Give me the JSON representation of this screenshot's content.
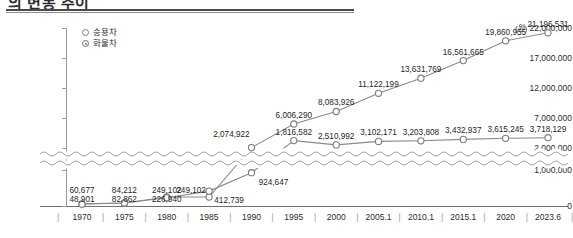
{
  "title": "의 변동 추이",
  "axis": {
    "unit_label": "(원)",
    "y_ticks": [
      "22,000,000",
      "17,000,000",
      "12,000,000",
      "7,000,000",
      "2,000,000",
      "1,000,000",
      "0"
    ],
    "x_ticks": [
      "1970",
      "1975",
      "1980",
      "1985",
      "1990",
      "1995",
      "2000",
      "2005.1",
      "2010.1",
      "2015.1",
      "2020",
      "2023.6"
    ]
  },
  "legend": [
    {
      "label": "승용차",
      "marker": "hollow-circle"
    },
    {
      "label": "화물차",
      "marker": "dot-circle"
    }
  ],
  "chart_data": {
    "type": "line",
    "title": "의 변동 추이",
    "xlabel": "",
    "ylabel": "(원)",
    "ylim": [
      0,
      22000000
    ],
    "grid": false,
    "legend_position": "top-left",
    "axis_break": {
      "between": [
        1000000,
        2000000
      ],
      "style": "wavy"
    },
    "categories": [
      "1970",
      "1975",
      "1980",
      "1985",
      "1990",
      "1995",
      "2000",
      "2005.1",
      "2010.1",
      "2015.1",
      "2020",
      "2023.6"
    ],
    "series": [
      {
        "name": "승용차",
        "values": [
          60677,
          84212,
          249102,
          249102,
          2074922,
          6006290,
          8083926,
          11122199,
          13631769,
          16561665,
          19860955,
          21196531
        ],
        "labels": [
          "60,677",
          "84,212",
          "249,102",
          "249,102",
          "2,074,922",
          "6,006,290",
          "8,083,926",
          "11,122,199",
          "13,631,769",
          "16,561,665",
          "19,860,955",
          "21,196,531"
        ]
      },
      {
        "name": "화물차",
        "values": [
          48901,
          82862,
          226940,
          412739,
          924647,
          1816582,
          2510992,
          3102171,
          3203808,
          3432937,
          3615245,
          3718129
        ],
        "labels": [
          "48,901",
          "82,862",
          "226,940",
          "412,739",
          "924,647",
          "1,816,582",
          "2,510,992",
          "3,102,171",
          "3,203,808",
          "3,432,937",
          "3,615,245",
          "3,718,129"
        ]
      }
    ]
  },
  "colors": {
    "line": "#8a8a8a",
    "marker_stroke": "#7c7c7c",
    "text": "#231f20",
    "axis": "#9a9a9a"
  }
}
